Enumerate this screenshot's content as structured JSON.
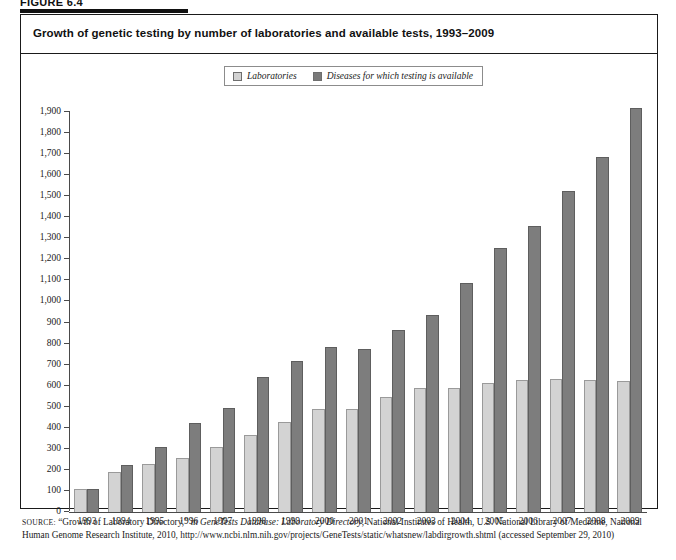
{
  "figure": {
    "number_label": "FIGURE 6.4"
  },
  "chart_title": "Growth of genetic testing by number of laboratories and available tests, 1993–2009",
  "legend": {
    "position": "top-center",
    "items": [
      {
        "label": "Laboratories",
        "color": "#d3d3d3",
        "swatch": "light-square-icon"
      },
      {
        "label": "Diseases for which testing is available",
        "color": "#7d7d7d",
        "swatch": "dark-square-icon"
      }
    ]
  },
  "source": {
    "lead": "SOURCE:",
    "part1": " “Growth of Laboratory Directory,” in ",
    "italic1": "GeneTests Database: Laboratory Directory",
    "part2": ", National Institutes of Health, U.S. National Library of Medicine, National Human Genome Research Institute, 2010, http://www.ncbi.nlm.nih.gov/projects/GeneTests/static/whatsnew/labdirgrowth.shtml (accessed September 29, 2010)"
  },
  "chart_data": {
    "type": "bar",
    "title": "Growth of genetic testing by number of laboratories and available tests, 1993–2009",
    "xlabel": "",
    "ylabel": "",
    "ylim": [
      0,
      1900
    ],
    "ytick_step": 100,
    "grid": false,
    "legend_position": "top-center",
    "categories": [
      "1993",
      "1994",
      "1995",
      "1996",
      "1997",
      "1998",
      "1999",
      "2000",
      "2001",
      "2002",
      "2003",
      "2004",
      "2005",
      "2006",
      "2007",
      "2008",
      "2009"
    ],
    "ytick_labels": [
      "0",
      "100",
      "200",
      "300",
      "400",
      "500",
      "600",
      "700",
      "800",
      "900",
      "1,000",
      "1,100",
      "1,200",
      "1,300",
      "1,400",
      "1,500",
      "1,600",
      "1,700",
      "1,800",
      "1,900"
    ],
    "series": [
      {
        "name": "Laboratories",
        "color": "#d3d3d3",
        "values": [
          110,
          190,
          230,
          255,
          310,
          365,
          428,
          490,
          490,
          545,
          590,
          590,
          615,
          628,
          632,
          625,
          620
        ]
      },
      {
        "name": "Diseases for which testing is available",
        "color": "#7d7d7d",
        "values": [
          110,
          225,
          308,
          425,
          493,
          640,
          715,
          782,
          775,
          865,
          935,
          1090,
          1255,
          1360,
          1525,
          1685,
          1920
        ]
      }
    ]
  }
}
